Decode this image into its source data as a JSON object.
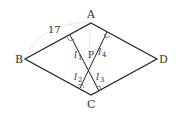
{
  "diagram": {
    "vertices": {
      "A": "A",
      "B": "B",
      "C": "C",
      "D": "D",
      "P": "P"
    },
    "side_label": "17",
    "lines": [
      {
        "name": "l",
        "sub": "1"
      },
      {
        "name": "l",
        "sub": "2"
      },
      {
        "name": "l",
        "sub": "3"
      },
      {
        "name": "l",
        "sub": "4"
      }
    ],
    "colors": {
      "stroke": "#222222",
      "dotted": "#bbbbbb"
    }
  }
}
